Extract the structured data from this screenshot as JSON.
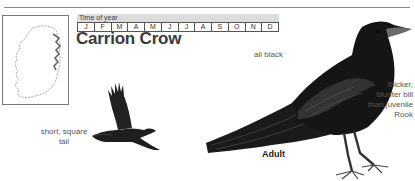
{
  "species": {
    "title": "Carrion Crow"
  },
  "time_of_year": {
    "header": "Time of year",
    "months": [
      "J",
      "F",
      "M",
      "A",
      "M",
      "J",
      "J",
      "A",
      "S",
      "O",
      "N",
      "D"
    ]
  },
  "map": {
    "icon": "ireland-distribution-map"
  },
  "illustrations": {
    "flying": {
      "icon": "crow-in-flight-illustration"
    },
    "perched": {
      "icon": "crow-perched-illustration"
    }
  },
  "annotations": {
    "tail": "short, square tail",
    "plumage": "all black",
    "bill_lines": [
      "thicker,",
      "blunter bill",
      "than juvenile",
      "Rook"
    ],
    "age": "Adult"
  },
  "colors": {
    "bird": "#1c1c1c",
    "bird_highlight": "#4a4a4a",
    "header_bar": "#dcdcdc",
    "text": "#555555"
  }
}
